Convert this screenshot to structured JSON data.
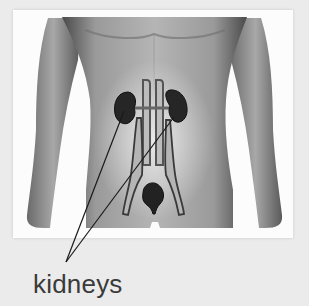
{
  "diagram": {
    "organs_shown": [
      "kidneys",
      "ureters",
      "bladder",
      "aorta",
      "vena cava"
    ],
    "label": "kidneys",
    "pointer_count": 2,
    "colors": {
      "background": "#ebebeb",
      "card": "#fcfcfc",
      "skin": "#8f8f8f",
      "organ": "#2a2a2a",
      "label_text": "#3a3a3a"
    }
  }
}
